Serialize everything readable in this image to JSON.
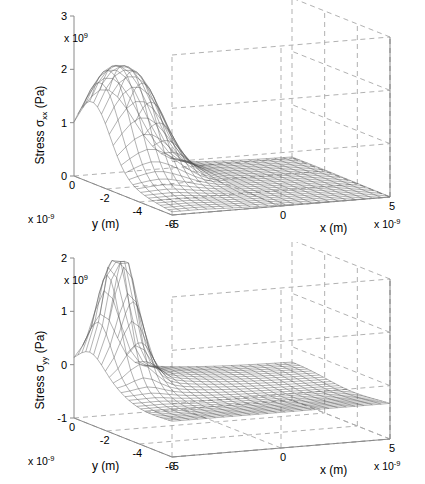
{
  "figure": {
    "background": "#ffffff",
    "mesh_color": "#555555",
    "axis_color": "#8a8a8a",
    "grid_color": "#a8a8a8"
  },
  "chart_data": [
    {
      "type": "surface",
      "id": "stress-xx",
      "title": "",
      "zlabel": "Stress σ",
      "zlabel_sub": "xx",
      "zlabel_unit": " (Pa)",
      "zlabel_full": "Stress σxx (Pa)",
      "xlabel": "x (m)",
      "ylabel": "y (m)",
      "z_exponent": "x 10",
      "z_exponent_power": "9",
      "x_exponent": "x 10",
      "x_exponent_power": "-9",
      "y_exponent": "x 10",
      "y_exponent_power": "-9",
      "zticks": [
        3,
        2,
        1,
        0
      ],
      "ztick_labels": [
        "3",
        "2",
        "1",
        "0"
      ],
      "zlim": [
        0,
        3
      ],
      "xticks": [
        -5,
        0,
        5
      ],
      "xtick_labels": [
        "-5",
        "0",
        "5"
      ],
      "xlim": [
        -5,
        5
      ],
      "yticks": [
        0,
        -2,
        -4,
        -6
      ],
      "ytick_labels": [
        "0",
        "-2",
        "-4",
        "-6"
      ],
      "ylim": [
        -6,
        0
      ],
      "grid": true,
      "legend": "none",
      "description": "Twin-peaked ridge near y=-1 to -2, x=-4, rising to about 2.4e9 Pa; decays to near 0 across positive x and negative y.",
      "peak_value": 2.4,
      "baseline_value": 0.0,
      "mesh_nx": 26,
      "mesh_ny": 26,
      "surface_model": {
        "kind": "twin-peak-ridge",
        "amplitude": 2.42,
        "peak_x": -3.6,
        "peak_y": -1.1,
        "ridge_split": 0.55,
        "sigma_x": 1.25,
        "sigma_y": 1.05,
        "tail_amplitude": 0.55,
        "tail_decay": 3.2,
        "floor": 0.0
      }
    },
    {
      "type": "surface",
      "id": "stress-yy",
      "title": "",
      "zlabel": "Stress σ",
      "zlabel_sub": "yy",
      "zlabel_unit": " (Pa)",
      "zlabel_full": "Stress σyy (Pa)",
      "xlabel": "x (m)",
      "ylabel": "y (m)",
      "z_exponent": "x 10",
      "z_exponent_power": "9",
      "x_exponent": "x 10",
      "x_exponent_power": "-9",
      "y_exponent": "x 10",
      "y_exponent_power": "-9",
      "zticks": [
        2,
        1,
        0,
        -1
      ],
      "ztick_labels": [
        "2",
        "1",
        "0",
        "-1"
      ],
      "zlim": [
        -1,
        2
      ],
      "xticks": [
        -5,
        0,
        5
      ],
      "xtick_labels": [
        "-5",
        "0",
        "5"
      ],
      "xlim": [
        -5,
        5
      ],
      "yticks": [
        0,
        -2,
        -4,
        -6
      ],
      "ytick_labels": [
        "0",
        "-2",
        "-4",
        "-6"
      ],
      "ylim": [
        -6,
        0
      ],
      "grid": true,
      "legend": "none",
      "description": "Single sharp spike near y=-1, x=-3.8 reaching about 2.0e9 Pa, falling to a flat plateau near -0.3e9 Pa over most of the domain.",
      "peak_value": 2.0,
      "baseline_value": -0.3,
      "mesh_nx": 26,
      "mesh_ny": 26,
      "surface_model": {
        "kind": "single-spike",
        "amplitude": 2.32,
        "peak_x": -3.7,
        "peak_y": -1.0,
        "sigma_x": 0.62,
        "sigma_y": 0.72,
        "tail_amplitude": 0.42,
        "tail_decay": 3.0,
        "floor": -0.3
      }
    }
  ],
  "origin_label": "0",
  "corner_labels": {
    "y_end": "-6",
    "x_start": "-5"
  }
}
